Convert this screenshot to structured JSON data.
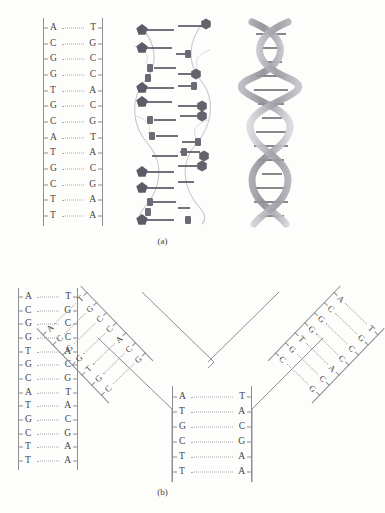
{
  "figure": {
    "panels": [
      {
        "id": "panel-a",
        "caption": "(a)",
        "representations": [
          "base-pair-ladder",
          "ball-and-stick-model",
          "double-helix-ribbon"
        ],
        "ladder": {
          "name": "dna-base-pair-ladder-a",
          "pairs": [
            {
              "left": "A",
              "right": "T"
            },
            {
              "left": "C",
              "right": "G"
            },
            {
              "left": "G",
              "right": "C"
            },
            {
              "left": "G",
              "right": "C"
            },
            {
              "left": "T",
              "right": "A"
            },
            {
              "left": "G",
              "right": "C"
            },
            {
              "left": "C",
              "right": "G"
            },
            {
              "left": "A",
              "right": "T"
            },
            {
              "left": "T",
              "right": "A"
            },
            {
              "left": "G",
              "right": "C"
            },
            {
              "left": "C",
              "right": "G"
            },
            {
              "left": "T",
              "right": "A"
            },
            {
              "left": "T",
              "right": "A"
            }
          ]
        }
      },
      {
        "id": "panel-b",
        "caption": "(b)",
        "ladder": {
          "name": "dna-base-pair-ladder-b",
          "pairs": [
            {
              "left": "A",
              "right": "T"
            },
            {
              "left": "C",
              "right": "G"
            },
            {
              "left": "G",
              "right": "C"
            },
            {
              "left": "G",
              "right": "C"
            },
            {
              "left": "T",
              "right": "A"
            },
            {
              "left": "G",
              "right": "C"
            },
            {
              "left": "C",
              "right": "G"
            },
            {
              "left": "A",
              "right": "T"
            },
            {
              "left": "T",
              "right": "A"
            },
            {
              "left": "G",
              "right": "C"
            },
            {
              "left": "C",
              "right": "G"
            },
            {
              "left": "T",
              "right": "A"
            },
            {
              "left": "T",
              "right": "A"
            }
          ]
        },
        "fork": {
          "name": "replication-fork",
          "left_arm": {
            "pairs": [
              {
                "left": "A",
                "right": "T"
              },
              {
                "left": "C",
                "right": "G"
              },
              {
                "left": "G",
                "right": "C"
              },
              {
                "left": "G",
                "right": "C"
              },
              {
                "left": "T",
                "right": "A"
              },
              {
                "left": "G",
                "right": "C"
              },
              {
                "left": "C",
                "right": "G"
              }
            ]
          },
          "right_arm": {
            "pairs": [
              {
                "left": "A",
                "right": "T"
              },
              {
                "left": "C",
                "right": "G"
              },
              {
                "left": "G",
                "right": "C"
              },
              {
                "left": "G",
                "right": "C"
              },
              {
                "left": "T",
                "right": "A"
              },
              {
                "left": "G",
                "right": "C"
              },
              {
                "left": "C",
                "right": "G"
              }
            ]
          },
          "stem": {
            "pairs": [
              {
                "left": "A",
                "right": "T"
              },
              {
                "left": "T",
                "right": "A"
              },
              {
                "left": "G",
                "right": "C"
              },
              {
                "left": "C",
                "right": "G"
              },
              {
                "left": "T",
                "right": "A"
              },
              {
                "left": "T",
                "right": "A"
              }
            ]
          }
        }
      }
    ]
  },
  "colors": {
    "background": "#fdfdfc",
    "base_text": "#434343",
    "rail": "#8e8e8e",
    "hydrogen_bond": "#a9a9a9",
    "model_node": "#5c5c68",
    "helix_ribbon": "#9a9aa0"
  }
}
